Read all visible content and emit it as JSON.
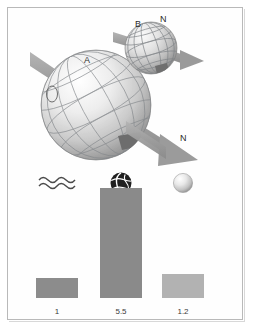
{
  "figure": {
    "title": "",
    "border_color": "#b9b9b9",
    "background": "#ffffff"
  },
  "diagram": {
    "labels": [
      {
        "id": "label-a",
        "text": "A"
      },
      {
        "id": "label-b",
        "text": "B"
      },
      {
        "id": "label-n-small",
        "text": "N"
      },
      {
        "id": "label-n-large",
        "text": "N"
      }
    ],
    "spheres": [
      {
        "name": "large-sphere",
        "label": "A",
        "pole_label": "N"
      },
      {
        "name": "small-sphere",
        "label": "B",
        "pole_label": "N"
      }
    ],
    "arrow_color": "#9b9b9b",
    "sphere_grid_color": "#7a7a7a"
  },
  "chart_data": {
    "type": "bar",
    "title": "",
    "xlabel": "",
    "ylabel": "",
    "categories": [
      "waves-icon",
      "globe-icon",
      "sphere-icon"
    ],
    "values": [
      1,
      5.5,
      1.2
    ],
    "value_labels": [
      "1",
      "5.5",
      "1.2"
    ],
    "ylim": [
      0,
      6
    ],
    "grid": false,
    "legend": "none",
    "bar_colors": [
      "#8c8c8c",
      "#8a8a8a",
      "#b2b2b2"
    ],
    "icons": [
      "waves-icon",
      "globe-icon",
      "sphere-icon"
    ]
  }
}
